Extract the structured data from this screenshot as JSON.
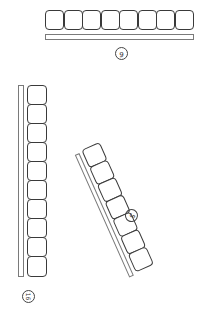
{
  "diagram": {
    "groups": [
      {
        "id": "top",
        "box_count": 8,
        "orientation": "horizontal",
        "label": "6",
        "label_rotation_deg": 180
      },
      {
        "id": "left",
        "box_count": 10,
        "orientation": "vertical",
        "label": "16",
        "label_rotation_deg": 90
      },
      {
        "id": "tilted",
        "box_count": 7,
        "orientation": "tilted",
        "label": "5",
        "label_rotation_deg": 120
      }
    ],
    "colors": {
      "stroke": "#3a3a3a",
      "bar_stroke": "#7a7a7a",
      "background": "#ffffff"
    }
  }
}
